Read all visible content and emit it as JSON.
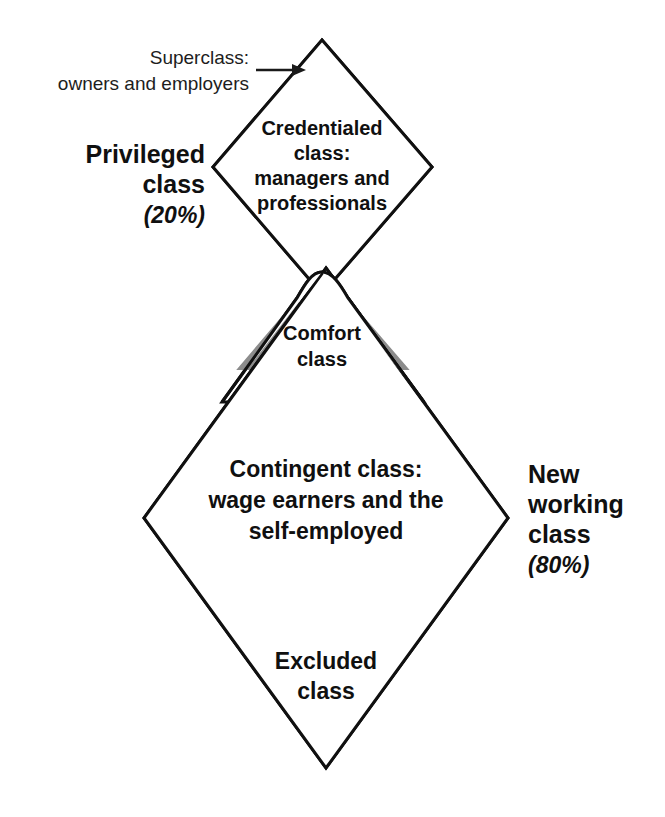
{
  "diagram": {
    "type": "class-structure-double-diamond",
    "colors": {
      "band_gray": "#8c8c8c",
      "outline": "#101010",
      "background": "#ffffff",
      "text": "#101010"
    },
    "callout": {
      "line1": "Superclass:",
      "line2": "owners and employers",
      "arrow": "arrow-right"
    },
    "upper_diamond": {
      "top_band_label": "",
      "body_label_lines": [
        "Credentialed",
        "class:",
        "managers and",
        "professionals"
      ],
      "side_label": {
        "line1": "Privileged",
        "line2": "class",
        "percent": "(20%)"
      }
    },
    "waist": {
      "band_label_lines": [
        "Comfort",
        "class"
      ]
    },
    "lower_diamond": {
      "body_label_lines": [
        "Contingent class:",
        "wage earners and the",
        "self-employed"
      ],
      "bottom_band_label_lines": [
        "Excluded",
        "class"
      ],
      "side_label": {
        "line1": "New",
        "line2": "working",
        "line3": "class",
        "percent": "(80%)"
      }
    }
  }
}
